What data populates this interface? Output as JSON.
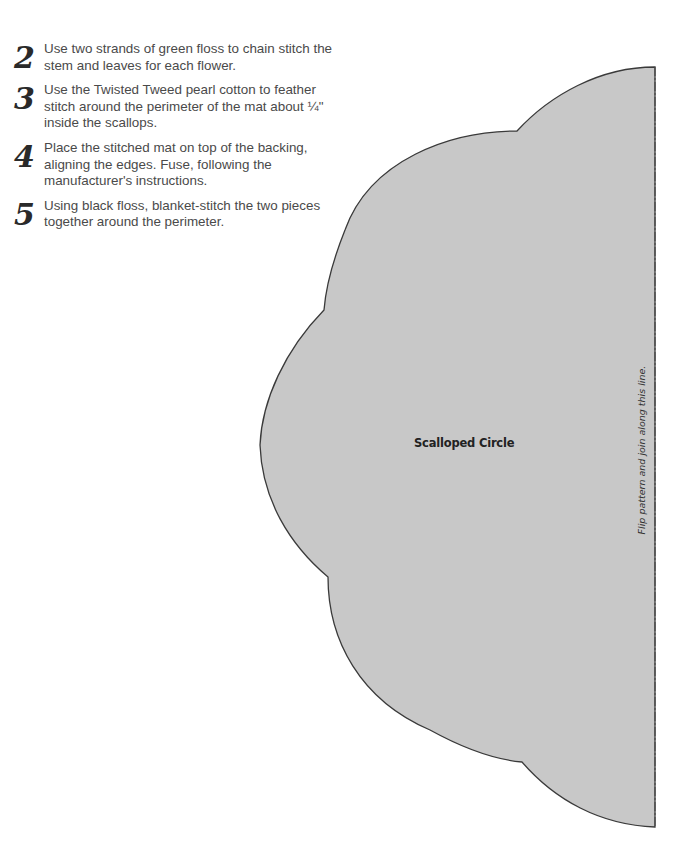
{
  "instructions": {
    "steps": [
      {
        "number": "2",
        "text": "Use two strands of green floss to chain stitch the stem and leaves for each flower."
      },
      {
        "number": "3",
        "text": "Use the Twisted Tweed pearl cotton to feather stitch around the perimeter of the mat about ¼\" inside the scallops."
      },
      {
        "number": "4",
        "text": "Place the stitched mat on top of the backing, aligning the edges. Fuse, following the manufacturer's instructions."
      },
      {
        "number": "5",
        "text": "Using black floss, blanket-stitch the two pieces together around the perimeter."
      }
    ]
  },
  "pattern": {
    "label": "Scalloped Circle",
    "fold_note": "Flip pattern and join along this line.",
    "fill_color": "#c8c8c8",
    "outline_color": "#3a3a3a"
  }
}
